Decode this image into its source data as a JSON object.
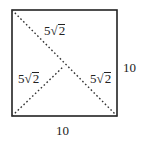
{
  "figure": {
    "shape": "square",
    "colors": {
      "stroke": "#222222",
      "background": "#ffffff"
    },
    "labels": {
      "top_diagonal": {
        "coef": "5",
        "radical": "√",
        "radicand": "2"
      },
      "left_segment": {
        "coef": "5",
        "radical": "√",
        "radicand": "2"
      },
      "right_segment": {
        "coef": "5",
        "radical": "√",
        "radicand": "2"
      },
      "right_side": "10",
      "bottom_side": "10"
    }
  }
}
